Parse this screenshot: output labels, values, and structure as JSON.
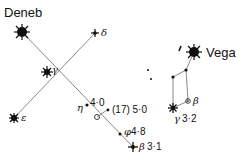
{
  "constellations": [
    {
      "name": "Cygnus",
      "stars": [
        {
          "id": "deneb",
          "label": "Deneb",
          "x": 22,
          "y": 32
        },
        {
          "id": "gamma",
          "label": "γ",
          "x": 47,
          "y": 72
        },
        {
          "id": "delta",
          "label": "δ",
          "x": 95,
          "y": 33
        },
        {
          "id": "epsilon",
          "label": "ε",
          "x": 14,
          "y": 118
        },
        {
          "id": "eta",
          "label": "η",
          "x": 87,
          "y": 105,
          "magnitude": "4·0"
        },
        {
          "id": "star17",
          "label": "(17)",
          "x": 107,
          "y": 110,
          "magnitude": "5·0"
        },
        {
          "id": "phi",
          "label": "φ",
          "x": 120,
          "y": 134,
          "magnitude": "4·8"
        },
        {
          "id": "beta",
          "label": "β",
          "x": 133,
          "y": 147,
          "magnitude": "3·1"
        }
      ]
    },
    {
      "name": "Lyra",
      "stars": [
        {
          "id": "vega",
          "label": "Vega",
          "x": 194,
          "y": 52
        },
        {
          "id": "epsilon-lyr",
          "label": "",
          "x": 180,
          "y": 49
        },
        {
          "id": "zeta",
          "label": "",
          "x": 186,
          "y": 70
        },
        {
          "id": "delta-lyr",
          "label": "",
          "x": 173,
          "y": 77
        },
        {
          "id": "beta-lyr",
          "label": "β",
          "x": 188,
          "y": 101
        },
        {
          "id": "gamma-lyr",
          "label": "γ",
          "x": 173,
          "y": 108,
          "magnitude": "3·2"
        }
      ]
    }
  ],
  "labels": {
    "deneb": "Deneb",
    "vega": "Vega",
    "gamma": "γ",
    "delta": "δ",
    "epsilon": "ε",
    "eta": "η",
    "eta_mag": "4·0",
    "star17": "(17) 5·0",
    "phi": "φ",
    "phi_mag": "4·8",
    "beta": "β",
    "beta_mag": "3·1",
    "beta_lyr": "β",
    "gamma_lyr": "γ",
    "gamma_lyr_mag": "3·2"
  }
}
